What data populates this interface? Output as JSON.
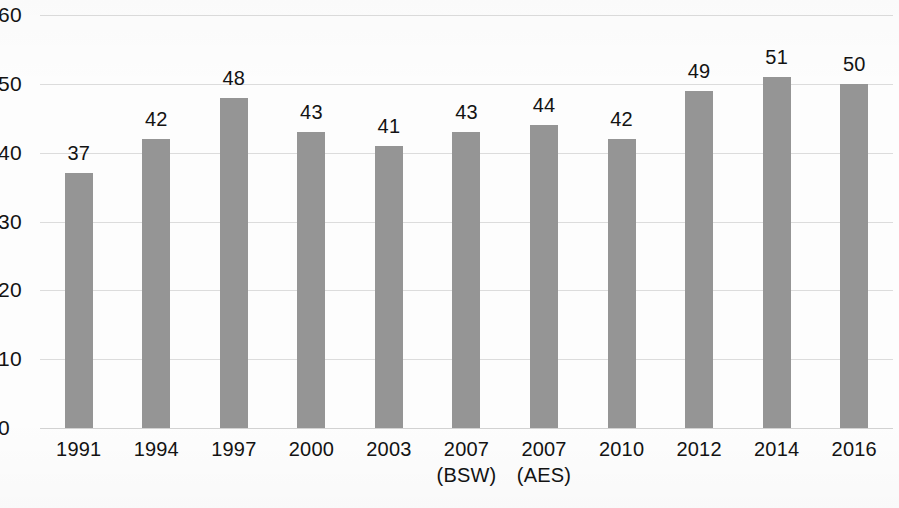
{
  "chart_data": {
    "type": "bar",
    "title": "",
    "subtitle": "",
    "xlabel": "",
    "ylabel": "",
    "categories": [
      "1991",
      "1994",
      "1997",
      "2000",
      "2003",
      "2007 (BSW)",
      "2007 (AES)",
      "2010",
      "2012",
      "2014",
      "2016"
    ],
    "category_lines": [
      [
        "1991",
        ""
      ],
      [
        "1994",
        ""
      ],
      [
        "1997",
        ""
      ],
      [
        "2000",
        ""
      ],
      [
        "2003",
        ""
      ],
      [
        "2007",
        "(BSW)"
      ],
      [
        "2007",
        "(AES)"
      ],
      [
        "2010",
        ""
      ],
      [
        "2012",
        ""
      ],
      [
        "2014",
        ""
      ],
      [
        "2016",
        ""
      ]
    ],
    "values": [
      37,
      42,
      48,
      43,
      41,
      43,
      44,
      42,
      49,
      51,
      50
    ],
    "value_labels": [
      "37",
      "42",
      "48",
      "43",
      "41",
      "43",
      "44",
      "42",
      "49",
      "51",
      "50"
    ],
    "ylim": [
      0,
      60
    ],
    "yticks": [
      0,
      10,
      20,
      30,
      40,
      50,
      60
    ],
    "ytick_labels": [
      "0",
      "10",
      "20",
      "30",
      "40",
      "50",
      "60"
    ],
    "grid": true,
    "grid_axis": "y",
    "legend": false,
    "legend_position": "none",
    "bar_color": "#959595",
    "grid_color": "#dcdcdc",
    "background_color": "#fdfdfd",
    "text_color": "#131313",
    "data_labels_shown": true
  }
}
